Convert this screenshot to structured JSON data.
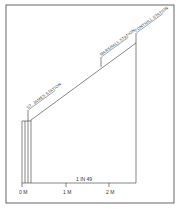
{
  "diagram": {
    "type": "gradient-profile",
    "stations": [
      {
        "name": "ST. JAMES STATION",
        "x": 28,
        "y": 121
      },
      {
        "name": "MARSHALL STATION",
        "x": 101,
        "y": 67
      },
      {
        "name": "FONTHILL STATION",
        "x": 136,
        "y": 43
      }
    ],
    "gradient_label": "1 IN 49",
    "axis": {
      "ticks": [
        {
          "label": "0 M",
          "x": 22
        },
        {
          "label": "1 M",
          "x": 66
        },
        {
          "label": "2 M",
          "x": 109
        }
      ]
    },
    "colors": {
      "line": "#333333",
      "frame": "#555555",
      "background": "#ffffff"
    }
  }
}
